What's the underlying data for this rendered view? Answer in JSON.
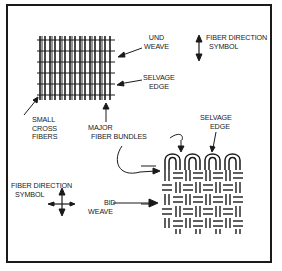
{
  "figure": {
    "labels": {
      "und_weave": [
        "UND",
        "WEAVE"
      ],
      "fiber_direction_top": [
        "FIBER DIRECTION",
        "SYMBOL"
      ],
      "selvage_edge_top": [
        "SELVAGE",
        "EDGE"
      ],
      "small_cross_fibers": [
        "SMALL",
        "CROSS",
        "FIBERS"
      ],
      "major_fiber_bundles": [
        "MAJOR",
        "FIBER BUNDLES"
      ],
      "selvage_edge_bottom": [
        "SELVAGE",
        "EDGE"
      ],
      "fiber_direction_bottom": [
        "FIBER DIRECTION",
        "SYMBOL"
      ],
      "bid_weave": [
        "BID",
        "WEAVE"
      ]
    },
    "colors": {
      "ink": "#1a1a1a",
      "paper": "#ffffff"
    }
  }
}
